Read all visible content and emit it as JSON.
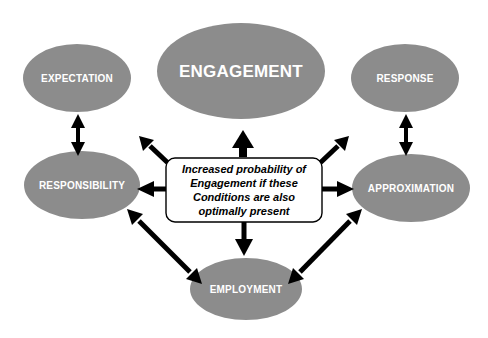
{
  "diagram": {
    "colors": {
      "node_fill": "#8c8c8c",
      "node_text": "#ffffff",
      "box_fill": "#ffffff",
      "box_stroke": "#000000",
      "arrow": "#000000",
      "background": "#ffffff"
    },
    "nodes": [
      {
        "id": "engagement",
        "label": "ENGAGEMENT",
        "shape": "ellipse",
        "size": "large",
        "cx": 241,
        "cy": 71,
        "rx": 84,
        "ry": 48
      },
      {
        "id": "expectation",
        "label": "EXPECTATION",
        "shape": "ellipse",
        "size": "small",
        "cx": 77,
        "cy": 78,
        "rx": 54,
        "ry": 34
      },
      {
        "id": "response",
        "label": "RESPONSE",
        "shape": "ellipse",
        "size": "small",
        "cx": 405,
        "cy": 78,
        "rx": 54,
        "ry": 34
      },
      {
        "id": "responsibility",
        "label": "RESPONSIBILITY",
        "shape": "ellipse",
        "size": "small",
        "cx": 82,
        "cy": 185,
        "rx": 58,
        "ry": 34
      },
      {
        "id": "approximation",
        "label": "APPROXIMATION",
        "shape": "ellipse",
        "size": "small",
        "cx": 411,
        "cy": 188,
        "rx": 59,
        "ry": 34
      },
      {
        "id": "employment",
        "label": "EMPLOYMENT",
        "shape": "ellipse",
        "size": "small",
        "cx": 246,
        "cy": 289,
        "rx": 56,
        "ry": 31
      }
    ],
    "center_box": {
      "id": "conditions-box",
      "lines": [
        "Increased probability of",
        "Engagement if these",
        "Conditions are also",
        "optimally present"
      ],
      "x": 166,
      "y": 158,
      "width": 156,
      "height": 64,
      "corner_radius": 9
    },
    "arrows": [
      {
        "id": "box-to-engagement",
        "from": "conditions-box",
        "to": "engagement",
        "heads": "single",
        "direction": "up",
        "thickness": "thick"
      },
      {
        "id": "box-to-responsibility",
        "from": "conditions-box",
        "to": "responsibility",
        "heads": "single",
        "direction": "left",
        "thickness": "medium"
      },
      {
        "id": "box-to-approximation",
        "from": "conditions-box",
        "to": "approximation",
        "heads": "single",
        "direction": "right",
        "thickness": "medium"
      },
      {
        "id": "box-to-employment",
        "from": "conditions-box",
        "to": "employment",
        "heads": "single",
        "direction": "down",
        "thickness": "medium"
      },
      {
        "id": "box-to-upper-left",
        "from": "conditions-box",
        "to": "expectation",
        "heads": "single",
        "direction": "up-left",
        "thickness": "medium"
      },
      {
        "id": "box-to-upper-right",
        "from": "conditions-box",
        "to": "response",
        "heads": "single",
        "direction": "up-right",
        "thickness": "medium"
      },
      {
        "id": "expectation-responsibility",
        "from": "expectation",
        "to": "responsibility",
        "heads": "double",
        "direction": "vertical",
        "thickness": "medium"
      },
      {
        "id": "response-approximation",
        "from": "response",
        "to": "approximation",
        "heads": "double",
        "direction": "vertical",
        "thickness": "medium"
      },
      {
        "id": "responsibility-employment",
        "from": "responsibility",
        "to": "employment",
        "heads": "double",
        "direction": "diagonal-down-right",
        "thickness": "medium"
      },
      {
        "id": "approximation-employment",
        "from": "approximation",
        "to": "employment",
        "heads": "double",
        "direction": "diagonal-down-left",
        "thickness": "medium"
      }
    ]
  }
}
